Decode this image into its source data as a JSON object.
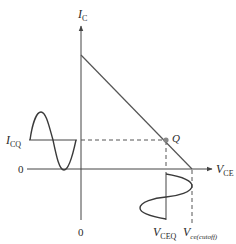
{
  "diagram": {
    "axes": {
      "y_label_main": "I",
      "y_label_sub": "C",
      "x_label_main": "V",
      "x_label_sub": "CE",
      "origin_x_label": "0",
      "origin_y_label": "0"
    },
    "labels": {
      "icq_main": "I",
      "icq_sub": "CQ",
      "q_point": "Q",
      "vceq_main": "V",
      "vceq_sub": "CEQ",
      "vcutoff_main": "V",
      "vcutoff_sub": "ce(cutoff)"
    },
    "colors": {
      "line": "#555555",
      "axis": "#444444",
      "curve": "#3a3a3a",
      "q_point": "#888888",
      "text": "#2a2a2a"
    },
    "elements": {
      "load_line": "DC load line from I-axis intercept to V_ce(cutoff)",
      "current_wave": "Sinusoidal collector current centered on I_CQ",
      "voltage_wave": "Sinusoidal collector-emitter voltage centered on V_CEQ"
    }
  }
}
